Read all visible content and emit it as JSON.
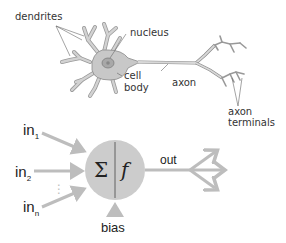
{
  "biological_neuron": {
    "labels": {
      "dendrites": "dendrites",
      "nucleus": "nucleus",
      "cell_body_line1": "cell",
      "cell_body_line2": "body",
      "axon": "axon",
      "axon_terminals_line1": "axon",
      "axon_terminals_line2": "terminals"
    }
  },
  "artificial_neuron": {
    "inputs": [
      {
        "base": "in",
        "sub": "1"
      },
      {
        "base": "in",
        "sub": "2"
      },
      {
        "base": "in",
        "sub": "n"
      }
    ],
    "ellipsis": "⋮",
    "sum_symbol": "Σ",
    "activation_symbol": "f",
    "bias_label": "bias",
    "output_label": "out"
  },
  "colors": {
    "neuron_fill": "#c8c8c8",
    "neuron_stroke": "#8a8a8a",
    "arrow": "#bdbdbd",
    "circle_fill": "#cccccc",
    "text": "#333333"
  }
}
